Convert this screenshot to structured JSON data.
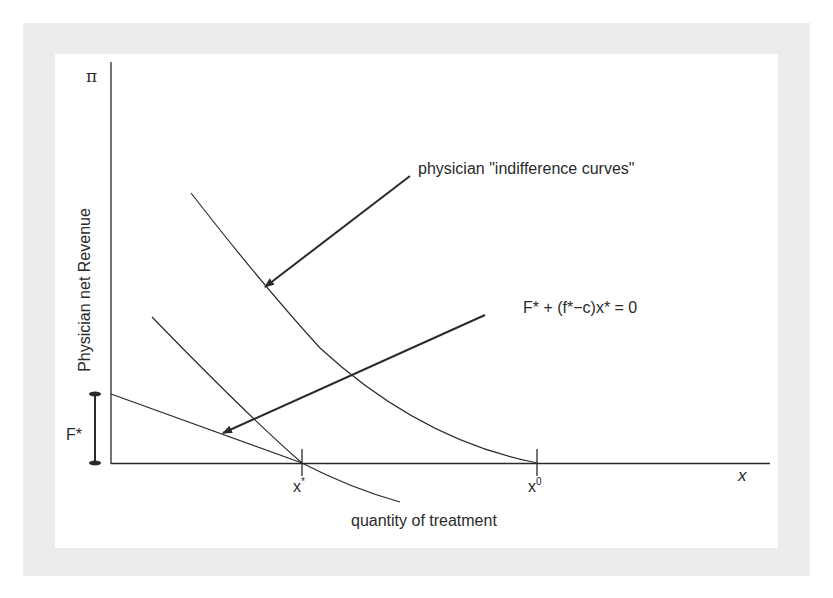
{
  "figure": {
    "y_axis_symbol": "π",
    "y_axis_label": "Physician net Revenue",
    "x_axis_symbol": "x",
    "x_axis_label": "quantity of treatment",
    "bracket_label": "F*",
    "ticks": [
      {
        "base": "x",
        "mark": "*"
      },
      {
        "base": "x",
        "mark": "0"
      }
    ],
    "annotations": {
      "indifference": "physician \"indifference curves\"",
      "constraint": "F* + (f*−c)x* = 0"
    },
    "colors": {
      "ink": "#2a2a2a",
      "frame": "#ececec",
      "panel": "#ffffff"
    },
    "elements": [
      "budget line (F* intercept, crosses x-axis at x*)",
      "lower indifference curve tangent at x*",
      "higher indifference curve reaching x-axis at x0"
    ]
  }
}
